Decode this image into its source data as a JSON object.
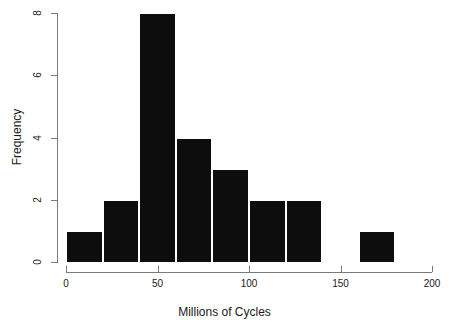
{
  "chart_data": {
    "type": "bar",
    "title": "",
    "subtitle": "",
    "xlabel": "Millions of Cycles",
    "ylabel": "Frequency",
    "xlim": [
      0,
      200
    ],
    "ylim": [
      0,
      8
    ],
    "xticks": [
      0,
      50,
      100,
      150,
      200
    ],
    "xtick_labels": [
      "0",
      "50",
      "100",
      "150",
      "200"
    ],
    "yticks": [
      0,
      2,
      4,
      6,
      8
    ],
    "ytick_labels": [
      "0",
      "2",
      "4",
      "6",
      "8"
    ],
    "grid": false,
    "legend": null,
    "bin_width": 20,
    "bin_edges": [
      0,
      20,
      40,
      60,
      80,
      100,
      120,
      140,
      160,
      180
    ],
    "categories": [
      "0-20",
      "20-40",
      "40-60",
      "60-80",
      "80-100",
      "100-120",
      "120-140",
      "140-160",
      "160-180"
    ],
    "values": [
      1,
      2,
      8,
      4,
      3,
      2,
      2,
      0,
      1
    ],
    "bars": [
      {
        "label": "0-20",
        "x0": 0,
        "x1": 20,
        "value": 1
      },
      {
        "label": "20-40",
        "x0": 20,
        "x1": 40,
        "value": 2
      },
      {
        "label": "40-60",
        "x0": 40,
        "x1": 60,
        "value": 8
      },
      {
        "label": "60-80",
        "x0": 60,
        "x1": 80,
        "value": 4
      },
      {
        "label": "80-100",
        "x0": 80,
        "x1": 100,
        "value": 3
      },
      {
        "label": "100-120",
        "x0": 100,
        "x1": 120,
        "value": 2
      },
      {
        "label": "120-140",
        "x0": 120,
        "x1": 140,
        "value": 2
      },
      {
        "label": "140-160",
        "x0": 140,
        "x1": 160,
        "value": 0
      },
      {
        "label": "160-180",
        "x0": 160,
        "x1": 180,
        "value": 1
      }
    ],
    "colors": {
      "bar_fill": "#0d0d0d",
      "bar_border": "#ffffff",
      "axis": "#7a7a7a",
      "text": "#1a1a1a",
      "background": "#ffffff"
    }
  }
}
